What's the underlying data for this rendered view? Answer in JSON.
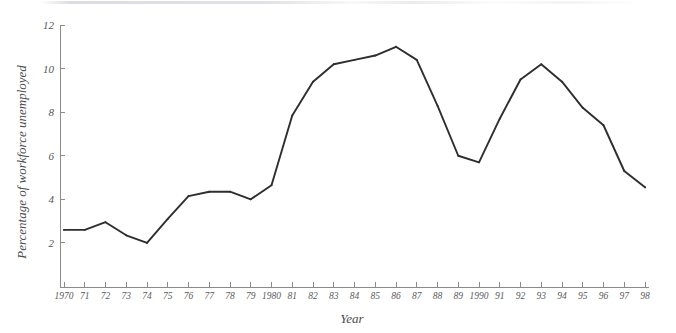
{
  "chart_data": {
    "type": "line",
    "title": "",
    "xlabel": "Year",
    "ylabel": "Percentage of workforce unemployed",
    "xlim": [
      1970,
      1998
    ],
    "ylim": [
      0,
      12
    ],
    "grid": false,
    "legend": null,
    "y_ticks": [
      2,
      4,
      6,
      8,
      10,
      12
    ],
    "y_tick_labels": [
      "2",
      "4",
      "6",
      "8",
      "10",
      "12"
    ],
    "x_ticks": [
      1970,
      1971,
      1972,
      1973,
      1974,
      1975,
      1976,
      1977,
      1978,
      1979,
      1980,
      1981,
      1982,
      1983,
      1984,
      1985,
      1986,
      1987,
      1988,
      1989,
      1990,
      1991,
      1992,
      1993,
      1994,
      1995,
      1996,
      1997,
      1998
    ],
    "x_tick_labels": [
      "1970",
      "71",
      "72",
      "73",
      "74",
      "75",
      "76",
      "77",
      "78",
      "79",
      "1980",
      "81",
      "82",
      "83",
      "84",
      "85",
      "86",
      "87",
      "88",
      "89",
      "1990",
      "91",
      "92",
      "93",
      "94",
      "95",
      "96",
      "97",
      "98"
    ],
    "series": [
      {
        "name": "Percentage of workforce unemployed",
        "color": "#2e2e30",
        "x": [
          1970,
          1971,
          1972,
          1973,
          1974,
          1975,
          1976,
          1977,
          1978,
          1979,
          1980,
          1981,
          1982,
          1983,
          1984,
          1985,
          1986,
          1987,
          1988,
          1989,
          1990,
          1991,
          1992,
          1993,
          1994,
          1995,
          1996,
          1997,
          1998
        ],
        "values": [
          2.6,
          2.6,
          2.95,
          2.35,
          2.0,
          3.1,
          4.15,
          4.35,
          4.35,
          4.0,
          4.65,
          7.85,
          9.4,
          10.2,
          10.4,
          10.6,
          11.0,
          10.4,
          8.3,
          6.0,
          5.7,
          7.7,
          9.5,
          10.2,
          9.4,
          8.2,
          7.4,
          5.3,
          4.55
        ]
      }
    ]
  },
  "figure": {
    "ylabel_text": "Percentage of workforce unemployed",
    "xlabel_text": "Year"
  }
}
